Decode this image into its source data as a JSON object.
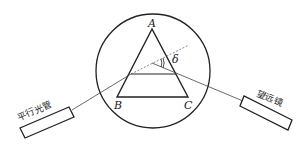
{
  "diagram": {
    "title": "",
    "type": "spectrometer prism minimum deviation setup",
    "nodes": [
      {
        "id": "A",
        "label": "A",
        "role": "prism apex"
      },
      {
        "id": "B",
        "label": "B",
        "role": "prism base left vertex"
      },
      {
        "id": "C",
        "label": "C",
        "role": "prism base right vertex"
      },
      {
        "id": "collimator",
        "label": "平行光管",
        "role": "collimator tube"
      },
      {
        "id": "telescope",
        "label": "望远镜",
        "role": "telescope tube"
      },
      {
        "id": "stage",
        "label": "",
        "role": "circular prism table"
      }
    ],
    "edges": [
      {
        "from": "collimator",
        "to": "prism-left-face",
        "style": "solid",
        "label": "incident ray"
      },
      {
        "from": "prism-left-face",
        "to": "prism-right-face",
        "style": "solid",
        "label": "refracted ray (parallel to BC)"
      },
      {
        "from": "prism-right-face",
        "to": "telescope",
        "style": "solid",
        "label": "emergent ray"
      },
      {
        "from": "prism-left-face",
        "to": "upper-right",
        "style": "dashed",
        "label": "extension of incident ray"
      }
    ],
    "annotations": [
      {
        "symbol": "δ",
        "meaning": "deviation angle"
      }
    ]
  },
  "labels": {
    "A": "A",
    "B": "B",
    "C": "C",
    "delta": "δ",
    "collimator": "平行光管",
    "telescope": "望远镜"
  },
  "colors": {
    "stroke": "#222222",
    "background": "#ffffff"
  }
}
